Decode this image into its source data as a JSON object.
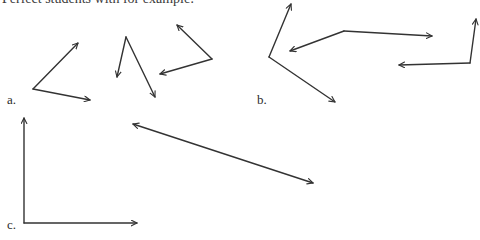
{
  "header": {
    "clipped_text": "Perfect students  with for example:"
  },
  "labels": {
    "a": "a.",
    "b": "b.",
    "c": "c."
  },
  "figures": [
    {
      "name": "figure-a-angle",
      "vertex": [
        33,
        89
      ],
      "ends": [
        [
          78,
          43
        ],
        [
          90,
          100
        ]
      ]
    },
    {
      "name": "figure-a2-angle",
      "vertex": [
        126,
        37
      ],
      "ends": [
        [
          117,
          77
        ],
        [
          155,
          97
        ]
      ]
    },
    {
      "name": "figure-a3-angle",
      "vertex": [
        212,
        59
      ],
      "ends": [
        [
          177,
          25
        ],
        [
          160,
          74
        ]
      ]
    },
    {
      "name": "figure-b-angle",
      "vertex": [
        269,
        57
      ],
      "ends": [
        [
          291,
          4
        ],
        [
          335,
          102
        ]
      ]
    },
    {
      "name": "figure-b2-angle",
      "vertex": [
        344,
        31
      ],
      "ends": [
        [
          290,
          51
        ],
        [
          432,
          36
        ]
      ]
    },
    {
      "name": "figure-b3-angle",
      "vertex": [
        470,
        63
      ],
      "ends": [
        [
          476,
          19
        ],
        [
          399,
          65
        ]
      ]
    },
    {
      "name": "figure-c-right-angle",
      "vertex": [
        24,
        223
      ],
      "ends": [
        [
          24,
          118
        ],
        [
          137,
          223
        ]
      ]
    }
  ],
  "double_arrow": {
    "from": [
      133,
      124
    ],
    "to": [
      313,
      183
    ]
  },
  "colors": {
    "stroke": "#333333",
    "background": "#ffffff"
  }
}
